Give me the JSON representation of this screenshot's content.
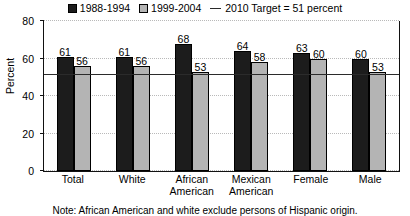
{
  "chart_data": {
    "type": "bar",
    "title": "",
    "xlabel": "",
    "ylabel": "Percent",
    "ylim": [
      0,
      80
    ],
    "yticks": [
      0,
      20,
      40,
      60,
      80
    ],
    "grid": true,
    "legend_position": "top-center",
    "categories": [
      "Total",
      "White",
      "African American",
      "Mexican American",
      "Female",
      "Male"
    ],
    "category_lines": [
      [
        "Total"
      ],
      [
        "White"
      ],
      [
        "African",
        "American"
      ],
      [
        "Mexican",
        "American"
      ],
      [
        "Female"
      ],
      [
        "Male"
      ]
    ],
    "series": [
      {
        "name": "1988-1994",
        "color": "#1c1c1c",
        "values": [
          61,
          61,
          68,
          64,
          63,
          60
        ]
      },
      {
        "name": "1999-2004",
        "color": "#b4b4b4",
        "values": [
          56,
          56,
          53,
          58,
          60,
          53
        ]
      }
    ],
    "reference_line": {
      "label": "2010 Target = 51 percent",
      "value": 51,
      "color": "#2b2b2b"
    },
    "note": "Note: African American and white exclude persons of Hispanic origin."
  },
  "legend": {
    "items": [
      {
        "label": "1988-1994"
      },
      {
        "label": "1999-2004"
      },
      {
        "label": "2010 Target = 51 percent"
      }
    ]
  }
}
